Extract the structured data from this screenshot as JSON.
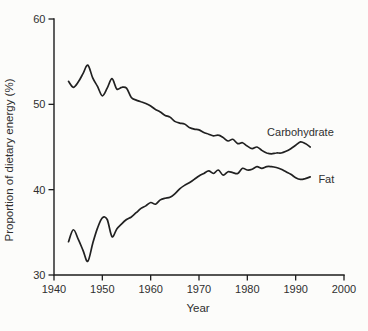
{
  "colors": {
    "background": "#fcfcfa",
    "line": "#212121",
    "axis": "#1d1d1d",
    "text": "#2f2f2f"
  },
  "chart_data": {
    "type": "line",
    "title": "",
    "xlabel": "Year",
    "ylabel": "Proportion of dietary energy (%)",
    "xlim": [
      1940,
      2000
    ],
    "ylim": [
      30,
      60
    ],
    "x_ticks": [
      1940,
      1950,
      1960,
      1970,
      1980,
      1990,
      2000
    ],
    "y_ticks": [
      60,
      50,
      40,
      30
    ],
    "grid": false,
    "legend_position": "inline-right",
    "x": [
      1943,
      1944,
      1945,
      1946,
      1947,
      1948,
      1949,
      1950,
      1951,
      1952,
      1953,
      1954,
      1955,
      1956,
      1957,
      1958,
      1959,
      1960,
      1961,
      1962,
      1963,
      1964,
      1965,
      1966,
      1967,
      1968,
      1969,
      1970,
      1971,
      1972,
      1973,
      1974,
      1975,
      1976,
      1977,
      1978,
      1979,
      1980,
      1981,
      1982,
      1983,
      1984,
      1985,
      1986,
      1987,
      1988,
      1989,
      1990,
      1991,
      1992,
      1993
    ],
    "series": [
      {
        "name": "Carbohydrate",
        "values": [
          52.7,
          52.0,
          52.6,
          53.6,
          54.6,
          53.1,
          52.1,
          51.0,
          51.9,
          53.0,
          51.8,
          52.0,
          51.9,
          50.8,
          50.5,
          50.3,
          50.1,
          49.8,
          49.4,
          49.1,
          48.7,
          48.5,
          48.0,
          47.8,
          47.7,
          47.3,
          47.1,
          47.0,
          46.7,
          46.5,
          46.3,
          46.4,
          46.1,
          45.7,
          45.9,
          45.4,
          45.5,
          45.1,
          44.8,
          45.0,
          44.6,
          44.3,
          44.2,
          44.3,
          44.3,
          44.5,
          44.8,
          45.2,
          45.6,
          45.4,
          45.0
        ]
      },
      {
        "name": "Fat",
        "values": [
          33.9,
          35.3,
          34.2,
          32.9,
          31.6,
          33.7,
          35.5,
          36.7,
          36.5,
          34.5,
          35.4,
          36.0,
          36.5,
          36.8,
          37.3,
          37.8,
          38.1,
          38.5,
          38.3,
          38.8,
          39.0,
          39.1,
          39.5,
          40.1,
          40.5,
          40.8,
          41.2,
          41.6,
          41.9,
          42.2,
          41.9,
          42.3,
          41.7,
          42.1,
          42.0,
          41.9,
          42.5,
          42.3,
          42.4,
          42.7,
          42.5,
          42.7,
          42.7,
          42.6,
          42.4,
          42.1,
          41.8,
          41.4,
          41.2,
          41.3,
          41.5
        ]
      }
    ],
    "annotations": [
      {
        "text": "Carbohydrate",
        "x": 1984.1,
        "y": 46.35
      },
      {
        "text": "Fat",
        "x": 1994.7,
        "y": 40.8
      }
    ]
  }
}
